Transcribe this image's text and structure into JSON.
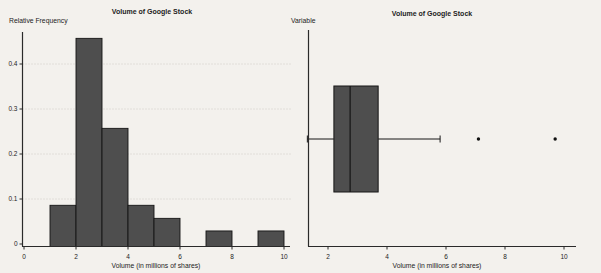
{
  "page": {
    "background": "#f3f1ed"
  },
  "style": {
    "bar_fill": "#4e4e4e",
    "bar_stroke": "#161616",
    "axis_color": "#2a2a2a",
    "grid_color": "#c7c4be",
    "outlier_color": "#111111"
  },
  "chart_data": [
    {
      "type": "bar",
      "subtype": "relative-frequency-histogram",
      "title": "Volume of Google Stock",
      "ylabel": "Relative Frequency",
      "xlabel": "Volume (in millions of shares)",
      "bins": [
        {
          "x0": 1,
          "x1": 2,
          "rel_freq": 0.086
        },
        {
          "x0": 2,
          "x1": 3,
          "rel_freq": 0.457
        },
        {
          "x0": 3,
          "x1": 4,
          "rel_freq": 0.257
        },
        {
          "x0": 4,
          "x1": 5,
          "rel_freq": 0.086
        },
        {
          "x0": 5,
          "x1": 6,
          "rel_freq": 0.057
        },
        {
          "x0": 7,
          "x1": 8,
          "rel_freq": 0.029
        },
        {
          "x0": 9,
          "x1": 10,
          "rel_freq": 0.029
        }
      ],
      "xticks": [
        {
          "value": 0,
          "label": "0"
        },
        {
          "value": 2,
          "label": "2"
        },
        {
          "value": 4,
          "label": "4"
        },
        {
          "value": 6,
          "label": "6"
        },
        {
          "value": 8,
          "label": "8"
        },
        {
          "value": 10,
          "label": "10"
        }
      ],
      "yticks": [
        {
          "value": 0,
          "label": "0"
        },
        {
          "value": 0.1,
          "label": "0.1"
        },
        {
          "value": 0.2,
          "label": "0.2"
        },
        {
          "value": 0.3,
          "label": "0.3"
        },
        {
          "value": 0.4,
          "label": "0.4"
        }
      ],
      "xlim": [
        0,
        10.2
      ],
      "ylim": [
        0,
        0.47
      ],
      "grid": "dotted-horizontal"
    },
    {
      "type": "boxplot",
      "orientation": "horizontal",
      "title": "Volume of Google Stock",
      "axis_label_top": "Variable",
      "xlabel": "Volume (in millions of shares)",
      "min": 1.3,
      "q1": 2.2,
      "median": 2.75,
      "q3": 3.7,
      "max_whisker": 5.8,
      "outliers": [
        7.1,
        9.7
      ],
      "xticks": [
        {
          "value": 2,
          "label": "2"
        },
        {
          "value": 4,
          "label": "4"
        },
        {
          "value": 6,
          "label": "6"
        },
        {
          "value": 8,
          "label": "8"
        },
        {
          "value": 10,
          "label": "10"
        }
      ],
      "xlim": [
        1.3,
        10.4
      ],
      "grid": "none"
    }
  ]
}
